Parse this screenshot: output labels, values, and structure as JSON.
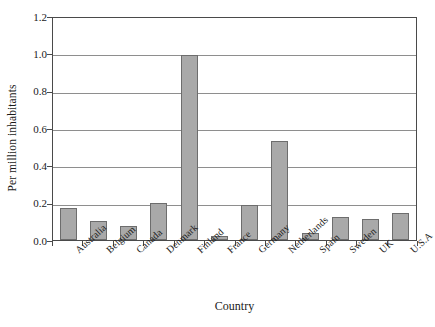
{
  "chart_data": {
    "type": "bar",
    "title": "",
    "xlabel": "Country",
    "ylabel": "Per million inhabitants",
    "categories": [
      "Australia",
      "Belgium",
      "Canada",
      "Denmark",
      "Finland",
      "France",
      "Germany",
      "Netherlands",
      "Spain",
      "Sweden",
      "UK",
      "U.S.A"
    ],
    "values": [
      0.17,
      0.1,
      0.075,
      0.2,
      0.99,
      0.02,
      0.19,
      0.53,
      0.035,
      0.125,
      0.11,
      0.145
    ],
    "ylim": [
      0.0,
      1.2
    ],
    "ytick_values": [
      0.0,
      0.2,
      0.4,
      0.6,
      0.8,
      1.0,
      1.2
    ],
    "ytick_labels": [
      "0.0",
      "0.2",
      "0.4",
      "0.6",
      "0.8",
      "1.0",
      "1.2"
    ],
    "grid": "horizontal",
    "legend": "none",
    "bar_color": "#a9a9a9",
    "bar_border_color": "#6d6d6d",
    "gridline_color": "#8e8e8e",
    "frame_color": "#4a4a4a",
    "background_color": "#ffffff"
  }
}
